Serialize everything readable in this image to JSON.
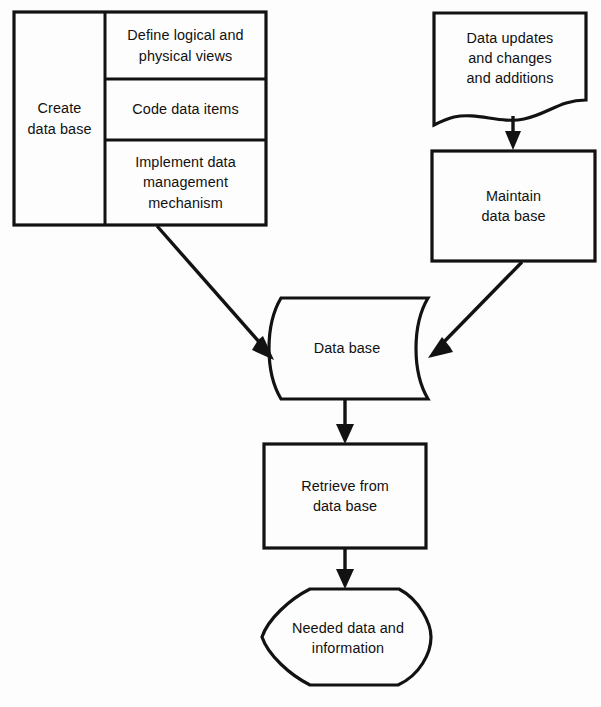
{
  "diagram": {
    "background_color": "#fdfdfd",
    "line_color": "#121212",
    "nodes": {
      "create_data_base": {
        "label": "Create\ndata base",
        "shape": "process-group"
      },
      "define_views": {
        "label": "Define logical and\nphysical views",
        "shape": "process"
      },
      "code_data_items": {
        "label": "Code data items",
        "shape": "process"
      },
      "implement_mechanism": {
        "label": "Implement data\nmanagement\nmechanism",
        "shape": "process"
      },
      "data_updates": {
        "label": "Data updates\nand changes\nand additions",
        "shape": "document"
      },
      "maintain_data_base": {
        "label": "Maintain\ndata base",
        "shape": "process"
      },
      "data_base": {
        "label": "Data base",
        "shape": "stored-data"
      },
      "retrieve_from_data_base": {
        "label": "Retrieve from\ndata base",
        "shape": "process"
      },
      "needed_data": {
        "label": "Needed data and\ninformation",
        "shape": "display"
      }
    },
    "connectors": [
      {
        "name": "create-to-database",
        "from": "create_data_base",
        "to": "data_base",
        "style": "diagonal-arrow"
      },
      {
        "name": "updates-to-maintain",
        "from": "data_updates",
        "to": "maintain_data_base",
        "style": "vertical-arrow"
      },
      {
        "name": "maintain-to-database",
        "from": "maintain_data_base",
        "to": "data_base",
        "style": "diagonal-arrow"
      },
      {
        "name": "database-to-retrieve",
        "from": "data_base",
        "to": "retrieve_from_data_base",
        "style": "vertical-arrow"
      },
      {
        "name": "retrieve-to-needed-data",
        "from": "retrieve_from_data_base",
        "to": "needed_data",
        "style": "vertical-arrow"
      }
    ]
  }
}
